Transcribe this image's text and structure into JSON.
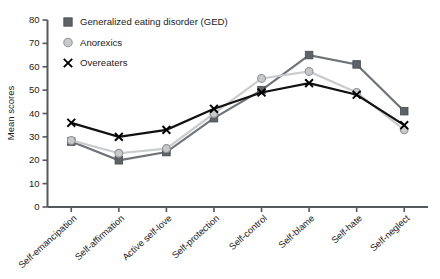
{
  "chart_data": {
    "type": "line",
    "title": "",
    "xlabel": "",
    "ylabel": "Mean scores",
    "ylim": [
      0,
      80
    ],
    "yticks": [
      0,
      10,
      20,
      30,
      40,
      50,
      60,
      70,
      80
    ],
    "grid": false,
    "legend_position": "top-left",
    "categories": [
      "Self-emancipation",
      "Self-affirmation",
      "Active self-love",
      "Self-protection",
      "Self-control",
      "Self-blame",
      "Self-hate",
      "Self-neglect"
    ],
    "series": [
      {
        "name": "Generalized eating disorder (GED)",
        "marker": "square",
        "color": "#5e6165",
        "values": [
          28,
          20,
          23.5,
          38,
          50,
          65,
          61,
          41
        ]
      },
      {
        "name": "Anorexics",
        "marker": "circle",
        "color": "#c7c9cb",
        "values": [
          28.5,
          23,
          25,
          40,
          55,
          58,
          49,
          33
        ]
      },
      {
        "name": "Overeaters",
        "marker": "x",
        "color": "#111111",
        "values": [
          36,
          30,
          33,
          42,
          49,
          53,
          48,
          35
        ]
      }
    ]
  },
  "legend": {
    "items": [
      {
        "label": "Generalized eating disorder (GED)",
        "marker": "square-marker"
      },
      {
        "label": "Anorexics",
        "marker": "circle-marker"
      },
      {
        "label": "Overeaters",
        "marker": "x-marker"
      }
    ]
  },
  "axes": {
    "y_title": "Mean scores",
    "y_tick_labels": [
      "80",
      "70",
      "60",
      "50",
      "40",
      "30",
      "20",
      "10",
      "0"
    ],
    "x_tick_labels": [
      "Self-emancipation",
      "Self-affirmation",
      "Active self-love",
      "Self-protection",
      "Self-control",
      "Self-blame",
      "Self-hate",
      "Self-neglect"
    ]
  },
  "colors": {
    "ged": "#5e6165",
    "anorexics": "#c7c9cb",
    "overeaters": "#111111",
    "axis": "#55585c",
    "text": "#1b1b1b",
    "background": "#ffffff"
  }
}
